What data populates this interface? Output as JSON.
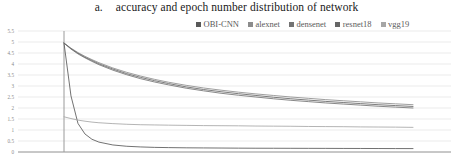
{
  "title": {
    "label": "a.",
    "text": "accuracy and epoch number distribution of network"
  },
  "legend": {
    "position": "top-right",
    "items": [
      {
        "label": "OBI-CNN",
        "color": "#595959"
      },
      {
        "label": "alexnet",
        "color": "#8c8c8c"
      },
      {
        "label": "densenet",
        "color": "#737373"
      },
      {
        "label": "resnet18",
        "color": "#666666"
      },
      {
        "label": "vgg19",
        "color": "#a6a6a6"
      }
    ]
  },
  "axes": {
    "y_ticks": [
      "5.5",
      "5",
      "4.5",
      "4",
      "3.5",
      "3",
      "2.5",
      "2",
      "1.5",
      "1",
      "0.5",
      "0"
    ],
    "grid": true,
    "x_axis_visible": true,
    "y_axis_visible": true
  },
  "chart_data": {
    "type": "line",
    "title": "a. accuracy and epoch number distribution of network",
    "xlabel": "",
    "ylabel": "",
    "ylim": [
      0,
      5.5
    ],
    "xlim": [
      0,
      100
    ],
    "grid": true,
    "legend_position": "top-right",
    "x": [
      0,
      2,
      4,
      6,
      8,
      10,
      14,
      18,
      22,
      26,
      30,
      35,
      40,
      45,
      50,
      55,
      60,
      65,
      70,
      75,
      80,
      85,
      90,
      95,
      100
    ],
    "series": [
      {
        "name": "OBI-CNN",
        "color": "#595959",
        "values": [
          4.95,
          2.55,
          1.3,
          0.82,
          0.58,
          0.45,
          0.32,
          0.26,
          0.23,
          0.21,
          0.2,
          0.19,
          0.185,
          0.18,
          0.175,
          0.172,
          0.17,
          0.168,
          0.166,
          0.164,
          0.162,
          0.16,
          0.158,
          0.156,
          0.155
        ]
      },
      {
        "name": "alexnet",
        "color": "#8c8c8c",
        "values": [
          4.95,
          4.72,
          4.52,
          4.35,
          4.2,
          4.06,
          3.82,
          3.62,
          3.45,
          3.3,
          3.17,
          3.03,
          2.91,
          2.81,
          2.72,
          2.64,
          2.57,
          2.5,
          2.44,
          2.38,
          2.33,
          2.28,
          2.23,
          2.19,
          2.15
        ]
      },
      {
        "name": "densenet",
        "color": "#737373",
        "values": [
          4.95,
          4.68,
          4.46,
          4.28,
          4.12,
          3.97,
          3.72,
          3.51,
          3.33,
          3.18,
          3.05,
          2.9,
          2.78,
          2.67,
          2.58,
          2.5,
          2.42,
          2.35,
          2.29,
          2.23,
          2.18,
          2.13,
          2.08,
          2.04,
          2.0
        ]
      },
      {
        "name": "resnet18",
        "color": "#666666",
        "values": [
          4.95,
          4.7,
          4.49,
          4.31,
          4.16,
          4.01,
          3.77,
          3.56,
          3.39,
          3.24,
          3.11,
          2.96,
          2.84,
          2.74,
          2.65,
          2.57,
          2.49,
          2.42,
          2.36,
          2.3,
          2.25,
          2.2,
          2.15,
          2.11,
          2.07
        ]
      },
      {
        "name": "vgg19",
        "color": "#a6a6a6",
        "values": [
          1.6,
          1.52,
          1.45,
          1.4,
          1.36,
          1.33,
          1.29,
          1.26,
          1.24,
          1.23,
          1.22,
          1.21,
          1.2,
          1.195,
          1.19,
          1.18,
          1.175,
          1.17,
          1.16,
          1.155,
          1.15,
          1.14,
          1.135,
          1.13,
          1.12
        ]
      }
    ],
    "annotations": []
  }
}
